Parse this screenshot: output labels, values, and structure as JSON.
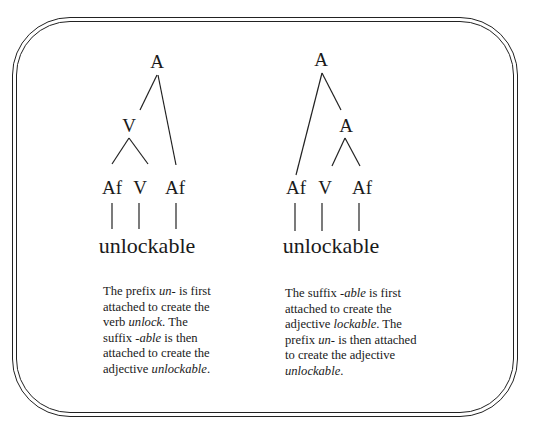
{
  "left_tree": {
    "nodes": {
      "root": "A",
      "v_mid": "V",
      "af1": "Af",
      "v": "V",
      "af2": "Af"
    },
    "word": "unlockable",
    "caption": {
      "l1_a": "The prefix ",
      "l1_b": "un-",
      "l1_c": " is first",
      "l2": "attached to create the",
      "l3_a": "verb ",
      "l3_b": "unlock",
      "l3_c": ". The",
      "l4_a": "suffix ",
      "l4_b": "-able",
      "l4_c": " is then",
      "l5": "attached to create the",
      "l6_a": "adjective ",
      "l6_b": "unlockable",
      "l6_c": "."
    }
  },
  "right_tree": {
    "nodes": {
      "root": "A",
      "a_mid": "A",
      "af1": "Af",
      "v": "V",
      "af2": "Af"
    },
    "word": "unlockable",
    "caption": {
      "l1_a": "The suffix ",
      "l1_b": "-able",
      "l1_c": " is first",
      "l2": "attached to create the",
      "l3_a": "adjective ",
      "l3_b": "lockable",
      "l3_c": ". The",
      "l4_a": "prefix ",
      "l4_b": "un-",
      "l4_c": " is then attached",
      "l5": "to create the adjective",
      "l6_b": "unlockable",
      "l6_c": "."
    }
  }
}
